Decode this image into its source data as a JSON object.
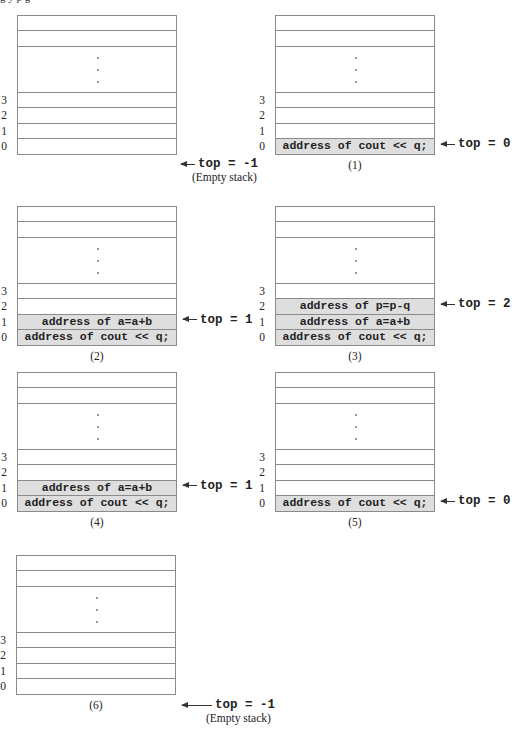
{
  "figure": {
    "top_fragment": "g                         y p                                                 g",
    "row_indices": [
      "3",
      "2",
      "1",
      "0"
    ],
    "empty_note": "(Empty stack)",
    "panels": [
      {
        "id": "initial",
        "caption": "",
        "cells": [
          "",
          "",
          "",
          ""
        ],
        "filled": [
          false,
          false,
          false,
          false
        ],
        "top_label": "top = -1",
        "top_row": -1,
        "note": "(Empty stack)"
      },
      {
        "id": "1",
        "caption": "(1)",
        "cells": [
          "",
          "",
          "",
          "address of cout << q;"
        ],
        "filled": [
          false,
          false,
          false,
          true
        ],
        "top_label": "top = 0",
        "top_row": 0
      },
      {
        "id": "2",
        "caption": "(2)",
        "cells": [
          "",
          "",
          "address of a=a+b",
          "address of cout << q;"
        ],
        "filled": [
          false,
          false,
          true,
          true
        ],
        "top_label": "top = 1",
        "top_row": 1
      },
      {
        "id": "3",
        "caption": "(3)",
        "cells": [
          "",
          "address of p=p-q",
          "address of a=a+b",
          "address of cout << q;"
        ],
        "filled": [
          false,
          true,
          true,
          true
        ],
        "top_label": "top = 2",
        "top_row": 2
      },
      {
        "id": "4",
        "caption": "(4)",
        "cells": [
          "",
          "",
          "address of a=a+b",
          "address of cout << q;"
        ],
        "filled": [
          false,
          false,
          true,
          true
        ],
        "top_label": "top = 1",
        "top_row": 1
      },
      {
        "id": "5",
        "caption": "(5)",
        "cells": [
          "",
          "",
          "",
          "address of cout << q;"
        ],
        "filled": [
          false,
          false,
          false,
          true
        ],
        "top_label": "top = 0",
        "top_row": 0
      },
      {
        "id": "6",
        "caption": "(6)",
        "cells": [
          "",
          "",
          "",
          ""
        ],
        "filled": [
          false,
          false,
          false,
          false
        ],
        "top_label": "top = -1",
        "top_row": -1,
        "note": "(Empty stack)"
      }
    ]
  },
  "colors": {
    "filled_cell": "#dedede",
    "border": "#8a8a8a",
    "text": "#222222"
  }
}
